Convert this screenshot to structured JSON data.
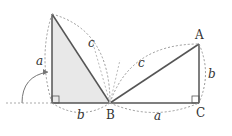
{
  "diagram": {
    "type": "geometry",
    "colors": {
      "stroke": "#555555",
      "fill": "#e8e8e8",
      "dashed": "#999999"
    },
    "left_triangle": {
      "side_labels": {
        "vertical": "a",
        "horizontal": "b",
        "hypotenuse": "c"
      },
      "vertex_labels": {
        "bottom_right": "B"
      }
    },
    "right_triangle": {
      "side_labels": {
        "horizontal": "a",
        "vertical": "b",
        "hypotenuse": "c"
      },
      "vertex_labels": {
        "top": "A",
        "bottom_right": "C",
        "bottom_left": "B"
      }
    }
  }
}
